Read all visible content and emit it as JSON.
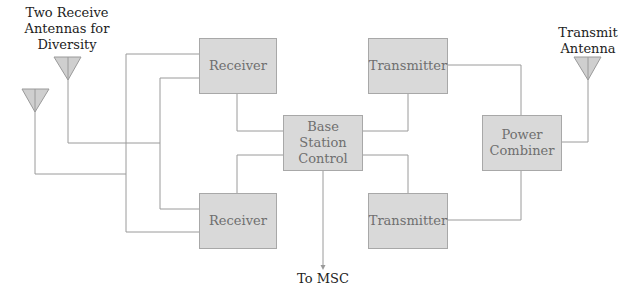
{
  "diagram": {
    "labels": {
      "receive_antennas": "Two Receive\nAntennas for\nDiversity",
      "transmit_antenna": "Transmit\nAntenna",
      "to_msc": "To MSC"
    },
    "blocks": {
      "receiver_top": "Receiver",
      "receiver_bottom": "Receiver",
      "base_station_control": "Base\nStation\nControl",
      "transmitter_top": "Transmitter",
      "transmitter_bottom": "Transmitter",
      "power_combiner": "Power\nCombiner"
    },
    "colors": {
      "block_fill": "#d9d9d9",
      "line": "#9a9a9a",
      "antenna_fill": "#cfcfcf"
    }
  }
}
